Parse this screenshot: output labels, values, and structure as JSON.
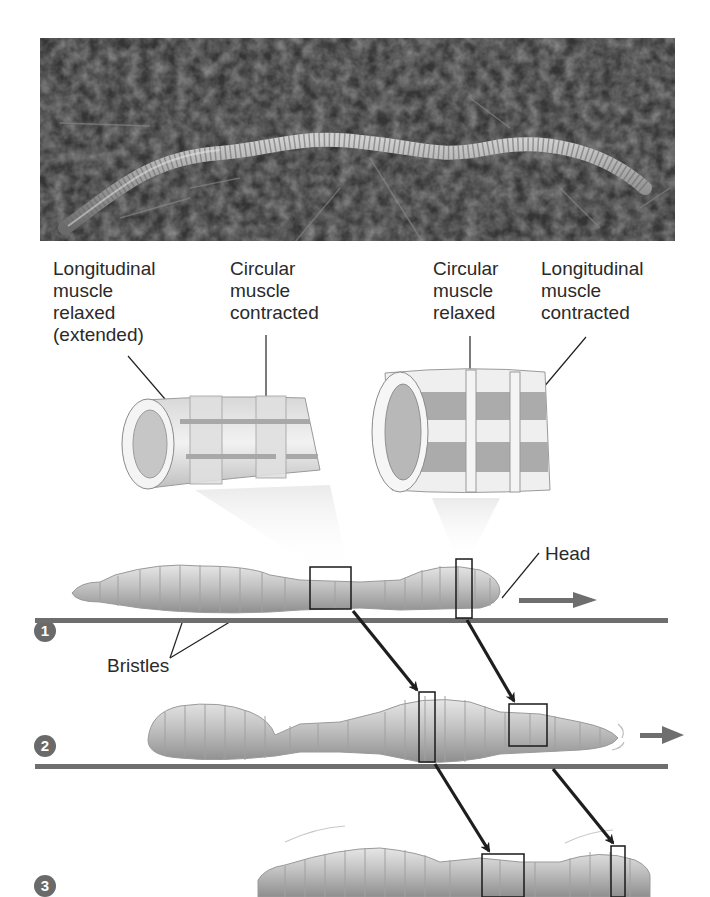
{
  "photo": {
    "subject": "earthworm on soil",
    "alt": "Photograph of an earthworm crawling on dark soil"
  },
  "labels": {
    "longitudinal_relaxed": "Longitudinal\nmuscle\nrelaxed\n(extended)",
    "circular_contracted": "Circular\nmuscle\ncontracted",
    "circular_relaxed": "Circular\nmuscle\nrelaxed",
    "longitudinal_contracted": "Longitudinal\nmuscle\ncontracted",
    "head": "Head",
    "bristles": "Bristles"
  },
  "steps": [
    {
      "number": "1"
    },
    {
      "number": "2"
    },
    {
      "number": "3"
    }
  ],
  "colors": {
    "ground_line": "#6e6e6e",
    "step_circle": "#6a6a6a",
    "arrow": "#1e1e1e",
    "motion_arrow": "#6e6e6e",
    "worm_body": "#b8b8b8",
    "text": "#2a2a2a"
  }
}
